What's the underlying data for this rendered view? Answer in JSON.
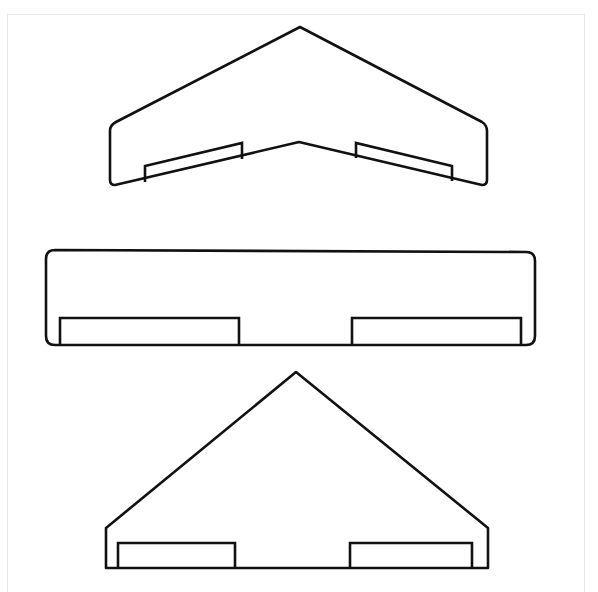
{
  "page": {
    "title": "Building elevation drawings",
    "width": 598,
    "height": 592,
    "background_color": "#ffffff",
    "frame_color": "#e9e9e9",
    "ink_color": "#111111"
  },
  "figures": [
    {
      "id": "figure-top",
      "name": "shallow-chevron-gable-elevation",
      "roof_type": "double pitch / chevron",
      "apex": {
        "x": 300,
        "y": 27
      },
      "valley": {
        "x": 299,
        "y": 142
      },
      "left_wall_x": 110,
      "right_wall_x": 487,
      "eave_left_y": 124,
      "eave_right_y": 124,
      "base_left_y": 185,
      "base_right_y": 185,
      "outline_path": "M 300 27 L 116 122 Q 110 125 110 131 L 110 180 Q 110 185 115 185 L 299 142 L 482 185 Q 487 185 487 180 L 487 131 Q 487 125 482 122 Z",
      "openings": [
        {
          "name": "door-left",
          "left_x": 145,
          "right_x": 242,
          "top_left_y": 166,
          "top_right_y": 143,
          "bottom_left_y": 182,
          "bottom_right_y": 159,
          "path": "M 145 182 L 145 166 L 242 143 L 242 159"
        },
        {
          "name": "door-right",
          "left_x": 356,
          "right_x": 452,
          "top_left_y": 143,
          "top_right_y": 166,
          "bottom_left_y": 158,
          "bottom_right_y": 181,
          "path": "M 356 158 L 356 143 L 452 166 L 452 181"
        }
      ]
    },
    {
      "id": "figure-middle",
      "name": "flat-roof-rectangular-elevation",
      "roof_type": "flat",
      "left_wall_x": 46,
      "right_wall_x": 535,
      "top_y": 250,
      "base_y": 345,
      "corner_radius": 9,
      "outline_path": "M 55 250 L 526 252 Q 535 252 535 261 L 535 336 Q 535 345 526 345 L 55 345 Q 46 345 46 336 L 46 259 Q 46 250 55 250 Z",
      "openings": [
        {
          "name": "door-left",
          "left_x": 60,
          "right_x": 239,
          "top_y": 318,
          "bottom_y": 345,
          "path": "M 60 345 L 60 318 L 239 318 L 239 345"
        },
        {
          "name": "door-right",
          "left_x": 352,
          "right_x": 521,
          "top_y": 318,
          "bottom_y": 345,
          "path": "M 352 345 L 352 318 L 521 318 L 521 345"
        }
      ]
    },
    {
      "id": "figure-bottom",
      "name": "steep-triangular-gable-elevation",
      "roof_type": "single steep pitch / gable",
      "apex": {
        "x": 296,
        "y": 372
      },
      "left_wall_x": 106,
      "right_wall_x": 488,
      "eave_left_y": 528,
      "eave_right_y": 528,
      "base_y": 568,
      "outline_path": "M 296 372 L 106 528 L 106 568 L 488 568 L 488 528 Z",
      "openings": [
        {
          "name": "door-left",
          "left_x": 118,
          "right_x": 235,
          "top_y": 543,
          "bottom_y": 568,
          "path": "M 118 568 L 118 543 L 235 543 L 235 568"
        },
        {
          "name": "door-right",
          "left_x": 350,
          "right_x": 472,
          "top_y": 543,
          "bottom_y": 568,
          "path": "M 350 568 L 350 543 L 472 543 L 472 568"
        }
      ]
    }
  ]
}
